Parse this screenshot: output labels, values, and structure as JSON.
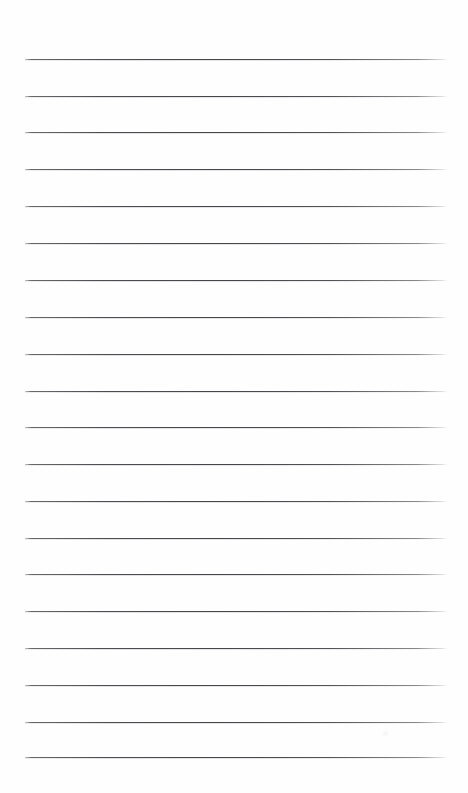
{
  "document": {
    "kind": "lined-notebook-page",
    "title": "Blank Ruled Paper",
    "page_width": 468,
    "page_height": 793,
    "background_color": "#ffffff",
    "paper_color": "#fefefe",
    "has_text_content": false,
    "visible_text": "",
    "orientation": "portrait"
  },
  "ruling": {
    "line_color": "#4e4e52",
    "line_color_faded_right": "#b2b2b6",
    "line_thickness_px": 1,
    "line_count": 20,
    "line_left_x": 25,
    "line_right_x": 447,
    "line_length_px": 422,
    "first_line_y": 59,
    "last_line_y": 757,
    "line_spacing_px": 36.7,
    "margin_top_px": 59,
    "margin_bottom_px": 36,
    "margin_left_px": 25,
    "margin_right_px": 21,
    "has_vertical_margin_rule": false,
    "line_positions_y": [
      59,
      96,
      132,
      169,
      206,
      243,
      280,
      317,
      354,
      391,
      427,
      464,
      501,
      538,
      574,
      611,
      648,
      685,
      722,
      757
    ]
  },
  "artifacts": {
    "scan_smudge": {
      "name": "faint-scan-smudge",
      "x": 381,
      "y": 730,
      "width": 9,
      "height": 7,
      "opacity": 0.35
    }
  }
}
